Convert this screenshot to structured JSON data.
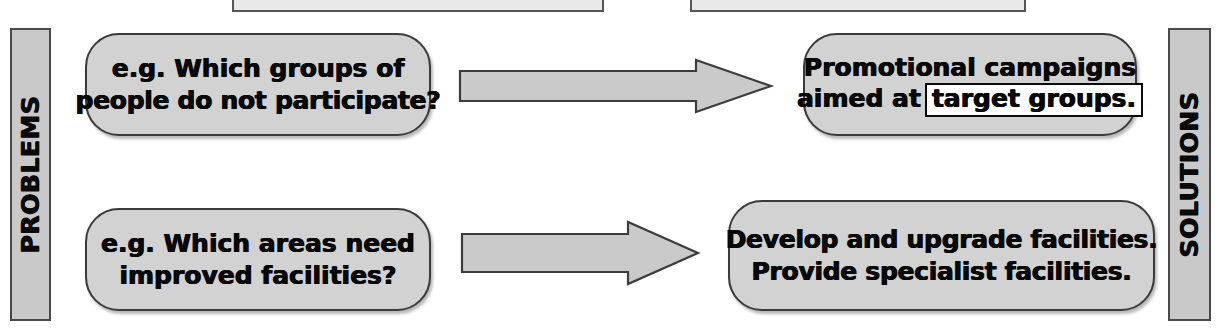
{
  "diagram": {
    "colors": {
      "box_fill": "#d2d2d2",
      "bar_fill": "#c9c9c9",
      "arrow_fill": "#cacaca",
      "outline": "#3a3a3a",
      "text": "#080808",
      "page_background": "#ffffff"
    },
    "top_clipped_text": "",
    "columns": {
      "left_label": "PROBLEMS",
      "right_label": "SOLUTIONS"
    },
    "top_boxes": [
      {
        "id": "topbox-left",
        "label": ""
      },
      {
        "id": "topbox-right",
        "label": ""
      }
    ],
    "rows": [
      {
        "problem": {
          "lines": [
            "e.g. Which groups of",
            "people do not participate?"
          ]
        },
        "arrow": {
          "direction": "right"
        },
        "solution": {
          "lines": [
            "Promotional campaigns"
          ],
          "line2_prefix": "aimed at",
          "line2_boxed_term": "target groups."
        }
      },
      {
        "problem": {
          "lines": [
            "e.g. Which areas need",
            "improved facilities?"
          ]
        },
        "arrow": {
          "direction": "right"
        },
        "solution": {
          "lines": [
            "Develop and upgrade facilities.",
            "Provide specialist facilities."
          ]
        }
      }
    ]
  }
}
